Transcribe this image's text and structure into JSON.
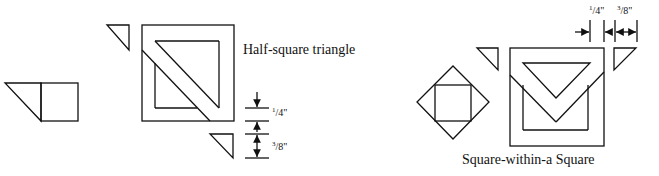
{
  "diagrams": {
    "half_square_triangle": {
      "caption": "Half-square triangle",
      "seam_allowance": "1/4\"",
      "extra_allowance": "3/8\"",
      "seam_allowance_parts": {
        "num": "1",
        "den": "4\""
      },
      "extra_allowance_parts": {
        "num": "3",
        "den": "8\""
      }
    },
    "square_within_a_square": {
      "caption": "Square-within-a Square",
      "seam_allowance": "1/4\"",
      "extra_allowance": "3/8\"",
      "seam_allowance_parts": {
        "num": "1",
        "den": "4\""
      },
      "extra_allowance_parts": {
        "num": "3",
        "den": "8\""
      }
    }
  },
  "colors": {
    "line": "#111111",
    "background": "#ffffff"
  }
}
